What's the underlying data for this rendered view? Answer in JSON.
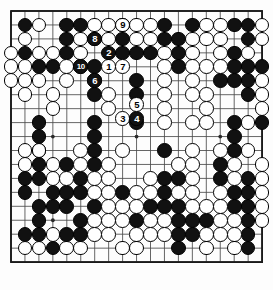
{
  "diagram": {
    "type": "go-board-diagram",
    "board_size": 19,
    "grid": {
      "origin_x": 11,
      "origin_y": 11,
      "spacing": 13.95,
      "line_color": "#4a4a4a",
      "border_color": "#1a1a1a",
      "background": "#fdfdfd",
      "star_points": [
        [
          3,
          3
        ],
        [
          9,
          3
        ],
        [
          15,
          3
        ],
        [
          3,
          9
        ],
        [
          9,
          9
        ],
        [
          15,
          9
        ],
        [
          3,
          15
        ],
        [
          9,
          15
        ],
        [
          15,
          15
        ]
      ]
    },
    "colors": {
      "black_stone": "#111111",
      "white_stone": "#ffffff",
      "stone_outline": "#000000",
      "black_label_text": "#ffffff",
      "white_label_text": "#000000"
    },
    "black_stones": [
      [
        1,
        1
      ],
      [
        4,
        1
      ],
      [
        5,
        1
      ],
      [
        8,
        1
      ],
      [
        11,
        1
      ],
      [
        13,
        1
      ],
      [
        16,
        1
      ],
      [
        17,
        1
      ],
      [
        4,
        2
      ],
      [
        8,
        2
      ],
      [
        11,
        2
      ],
      [
        12,
        2
      ],
      [
        17,
        2
      ],
      [
        1,
        3
      ],
      [
        4,
        3
      ],
      [
        8,
        3
      ],
      [
        9,
        3
      ],
      [
        10,
        3
      ],
      [
        12,
        3
      ],
      [
        16,
        3
      ],
      [
        2,
        4
      ],
      [
        3,
        4
      ],
      [
        6,
        4
      ],
      [
        12,
        4
      ],
      [
        16,
        4
      ],
      [
        17,
        4
      ],
      [
        18,
        4
      ],
      [
        9,
        5
      ],
      [
        15,
        5
      ],
      [
        16,
        5
      ],
      [
        17,
        5
      ],
      [
        6,
        6
      ],
      [
        9,
        6
      ],
      [
        17,
        6
      ],
      [
        2,
        8
      ],
      [
        6,
        8
      ],
      [
        9,
        8
      ],
      [
        16,
        8
      ],
      [
        18,
        8
      ],
      [
        2,
        9
      ],
      [
        6,
        9
      ],
      [
        16,
        9
      ],
      [
        2,
        10
      ],
      [
        6,
        10
      ],
      [
        11,
        10
      ],
      [
        16,
        10
      ],
      [
        2,
        11
      ],
      [
        4,
        11
      ],
      [
        6,
        11
      ],
      [
        15,
        11
      ],
      [
        1,
        12
      ],
      [
        2,
        12
      ],
      [
        5,
        12
      ],
      [
        11,
        12
      ],
      [
        12,
        12
      ],
      [
        15,
        12
      ],
      [
        17,
        12
      ],
      [
        1,
        13
      ],
      [
        3,
        13
      ],
      [
        4,
        13
      ],
      [
        5,
        13
      ],
      [
        8,
        13
      ],
      [
        11,
        13
      ],
      [
        16,
        13
      ],
      [
        17,
        13
      ],
      [
        2,
        14
      ],
      [
        3,
        14
      ],
      [
        4,
        14
      ],
      [
        6,
        14
      ],
      [
        10,
        14
      ],
      [
        11,
        14
      ],
      [
        12,
        14
      ],
      [
        16,
        14
      ],
      [
        17,
        14
      ],
      [
        2,
        15
      ],
      [
        5,
        15
      ],
      [
        9,
        15
      ],
      [
        12,
        15
      ],
      [
        13,
        15
      ],
      [
        14,
        15
      ],
      [
        17,
        15
      ],
      [
        1,
        16
      ],
      [
        2,
        16
      ],
      [
        4,
        16
      ],
      [
        5,
        16
      ],
      [
        12,
        16
      ],
      [
        13,
        16
      ],
      [
        17,
        16
      ],
      [
        3,
        17
      ],
      [
        12,
        17
      ],
      [
        17,
        17
      ]
    ],
    "white_stones": [
      [
        2,
        1
      ],
      [
        6,
        1
      ],
      [
        7,
        1
      ],
      [
        9,
        1
      ],
      [
        10,
        1
      ],
      [
        14,
        1
      ],
      [
        15,
        1
      ],
      [
        18,
        1
      ],
      [
        1,
        2
      ],
      [
        5,
        2
      ],
      [
        6,
        2
      ],
      [
        7,
        2
      ],
      [
        9,
        2
      ],
      [
        10,
        2
      ],
      [
        13,
        2
      ],
      [
        14,
        2
      ],
      [
        15,
        2
      ],
      [
        18,
        2
      ],
      [
        0,
        3
      ],
      [
        2,
        3
      ],
      [
        3,
        3
      ],
      [
        5,
        3
      ],
      [
        11,
        3
      ],
      [
        13,
        3
      ],
      [
        15,
        3
      ],
      [
        17,
        3
      ],
      [
        0,
        4
      ],
      [
        1,
        4
      ],
      [
        4,
        4
      ],
      [
        5,
        4
      ],
      [
        11,
        4
      ],
      [
        13,
        4
      ],
      [
        14,
        4
      ],
      [
        15,
        4
      ],
      [
        0,
        5
      ],
      [
        1,
        5
      ],
      [
        2,
        5
      ],
      [
        4,
        5
      ],
      [
        6,
        5
      ],
      [
        11,
        5
      ],
      [
        13,
        5
      ],
      [
        18,
        5
      ],
      [
        1,
        6
      ],
      [
        3,
        6
      ],
      [
        7,
        6
      ],
      [
        11,
        6
      ],
      [
        13,
        6
      ],
      [
        14,
        6
      ],
      [
        18,
        6
      ],
      [
        3,
        7
      ],
      [
        7,
        7
      ],
      [
        11,
        7
      ],
      [
        14,
        7
      ],
      [
        18,
        7
      ],
      [
        11,
        8
      ],
      [
        13,
        8
      ],
      [
        14,
        8
      ],
      [
        17,
        8
      ],
      [
        1,
        10
      ],
      [
        2,
        10
      ],
      [
        5,
        10
      ],
      [
        8,
        10
      ],
      [
        13,
        10
      ],
      [
        15,
        10
      ],
      [
        17,
        10
      ],
      [
        1,
        11
      ],
      [
        3,
        11
      ],
      [
        5,
        11
      ],
      [
        7,
        11
      ],
      [
        12,
        11
      ],
      [
        13,
        11
      ],
      [
        16,
        11
      ],
      [
        18,
        11
      ],
      [
        3,
        12
      ],
      [
        4,
        12
      ],
      [
        6,
        12
      ],
      [
        7,
        12
      ],
      [
        10,
        12
      ],
      [
        13,
        12
      ],
      [
        16,
        12
      ],
      [
        18,
        12
      ],
      [
        6,
        13
      ],
      [
        7,
        13
      ],
      [
        9,
        13
      ],
      [
        10,
        13
      ],
      [
        12,
        13
      ],
      [
        13,
        13
      ],
      [
        15,
        13
      ],
      [
        18,
        13
      ],
      [
        7,
        14
      ],
      [
        8,
        14
      ],
      [
        9,
        14
      ],
      [
        13,
        14
      ],
      [
        14,
        14
      ],
      [
        15,
        14
      ],
      [
        18,
        14
      ],
      [
        6,
        15
      ],
      [
        7,
        15
      ],
      [
        8,
        15
      ],
      [
        10,
        15
      ],
      [
        11,
        15
      ],
      [
        15,
        15
      ],
      [
        16,
        15
      ],
      [
        18,
        15
      ],
      [
        3,
        16
      ],
      [
        6,
        16
      ],
      [
        7,
        16
      ],
      [
        9,
        16
      ],
      [
        10,
        16
      ],
      [
        11,
        16
      ],
      [
        14,
        16
      ],
      [
        15,
        16
      ],
      [
        16,
        16
      ],
      [
        1,
        17
      ],
      [
        2,
        17
      ],
      [
        4,
        17
      ],
      [
        5,
        17
      ],
      [
        8,
        17
      ],
      [
        9,
        17
      ],
      [
        14,
        17
      ],
      [
        16,
        17
      ]
    ],
    "numbered_moves": [
      {
        "n": "1",
        "color": "white",
        "col": 7,
        "row": 4
      },
      {
        "n": "2",
        "color": "black",
        "col": 7,
        "row": 3
      },
      {
        "n": "3",
        "color": "white",
        "col": 8,
        "row": 7.7
      },
      {
        "n": "4",
        "color": "black",
        "col": 9,
        "row": 7.7
      },
      {
        "n": "5",
        "color": "white",
        "col": 9,
        "row": 6.7
      },
      {
        "n": "6",
        "color": "black",
        "col": 6,
        "row": 5
      },
      {
        "n": "7",
        "color": "white",
        "col": 8,
        "row": 4
      },
      {
        "n": "8",
        "color": "black",
        "col": 6,
        "row": 2
      },
      {
        "n": "9",
        "color": "white",
        "col": 8,
        "row": 1
      },
      {
        "n": "10",
        "color": "black",
        "col": 5,
        "row": 4
      }
    ]
  }
}
